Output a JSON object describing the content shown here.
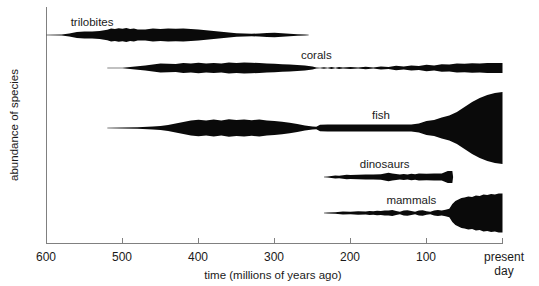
{
  "figure": {
    "title": "",
    "background_color": "#ffffff",
    "ink_color": "#0a0a0a",
    "axis_color": "#808080"
  },
  "axes": {
    "x_axis_title": "time (millions of years ago)",
    "y_axis_title": "abundance of species",
    "x_ticks": [
      {
        "label": "600",
        "value": 600
      },
      {
        "label": "500",
        "value": 500
      },
      {
        "label": "400",
        "value": 400
      },
      {
        "label": "300",
        "value": 300
      },
      {
        "label": "200",
        "value": 200
      },
      {
        "label": "100",
        "value": 100
      },
      {
        "label": "present",
        "label2": "day",
        "value": 0
      }
    ]
  },
  "chart_data": {
    "type": "area",
    "title": "",
    "subtitle": "",
    "xlabel": "time (millions of years ago)",
    "ylabel": "abundance of species",
    "xlim": [
      600,
      0
    ],
    "ylim": [
      0,
      1
    ],
    "x_reversed": true,
    "grid": false,
    "legend_position": "inline-labels",
    "annotations": [
      "trilobites",
      "corals",
      "fish",
      "dinosaurs",
      "mammals"
    ],
    "note": "Spindle diagram: each series is a horizontal lens whose half-thickness encodes abundance of species over geologic time.",
    "series": [
      {
        "name": "trilobites",
        "label": "trilobites",
        "label_x": 540,
        "start_mya": 600,
        "end_mya": 255,
        "x": [
          600,
          580,
          570,
          560,
          550,
          540,
          530,
          520,
          515,
          510,
          505,
          500,
          495,
          490,
          485,
          480,
          470,
          460,
          450,
          440,
          430,
          420,
          410,
          400,
          390,
          380,
          370,
          360,
          350,
          340,
          330,
          320,
          310,
          300,
          290,
          280,
          270,
          260,
          255
        ],
        "half_width": [
          0.2,
          0.4,
          1.6,
          3.0,
          3.4,
          3.6,
          4.0,
          5.2,
          6.4,
          6.0,
          6.8,
          6.2,
          7.0,
          6.0,
          6.6,
          5.6,
          5.6,
          6.4,
          6.0,
          6.4,
          6.2,
          6.4,
          6.0,
          5.4,
          4.8,
          4.0,
          3.2,
          2.4,
          1.8,
          1.4,
          1.2,
          1.6,
          2.0,
          2.2,
          1.8,
          1.2,
          0.8,
          0.4,
          0.2
        ]
      },
      {
        "name": "corals",
        "label": "corals",
        "label_x": 245,
        "start_mya": 520,
        "end_mya": 0,
        "x": [
          520,
          500,
          480,
          470,
          460,
          450,
          440,
          430,
          420,
          410,
          400,
          390,
          380,
          370,
          360,
          350,
          340,
          330,
          320,
          310,
          300,
          290,
          280,
          270,
          260,
          250,
          245,
          240,
          235,
          230,
          225,
          220,
          215,
          210,
          200,
          190,
          180,
          170,
          160,
          150,
          140,
          130,
          120,
          110,
          100,
          90,
          80,
          70,
          60,
          50,
          40,
          30,
          20,
          10,
          0
        ],
        "half_width": [
          0.2,
          0.3,
          1.8,
          2.4,
          3.6,
          4.6,
          4.2,
          4.0,
          5.0,
          4.6,
          5.2,
          4.4,
          5.0,
          4.6,
          5.4,
          5.0,
          5.6,
          5.2,
          5.0,
          4.6,
          4.2,
          3.8,
          3.4,
          3.0,
          2.4,
          1.4,
          0.4,
          0.2,
          0.8,
          0.3,
          0.9,
          0.3,
          1.0,
          0.4,
          1.0,
          0.5,
          1.2,
          0.6,
          1.4,
          1.0,
          2.2,
          1.6,
          2.4,
          2.0,
          3.2,
          2.6,
          3.8,
          3.4,
          4.4,
          4.2,
          4.8,
          4.6,
          5.0,
          5.0,
          5.0
        ]
      },
      {
        "name": "fish",
        "label": "fish",
        "label_x": 160,
        "start_mya": 520,
        "end_mya": 0,
        "x": [
          520,
          500,
          480,
          460,
          450,
          440,
          430,
          420,
          410,
          400,
          390,
          380,
          370,
          360,
          350,
          340,
          330,
          320,
          310,
          300,
          290,
          280,
          270,
          260,
          250,
          245,
          240,
          230,
          220,
          210,
          200,
          190,
          180,
          170,
          160,
          150,
          140,
          130,
          120,
          110,
          100,
          90,
          80,
          70,
          60,
          50,
          40,
          30,
          20,
          10,
          0
        ],
        "half_width": [
          0.2,
          0.4,
          0.8,
          1.4,
          2.0,
          3.0,
          4.6,
          6.0,
          7.4,
          8.2,
          7.4,
          8.4,
          7.6,
          8.8,
          8.0,
          8.6,
          7.8,
          8.4,
          7.6,
          7.0,
          6.2,
          5.2,
          4.0,
          2.6,
          1.6,
          1.2,
          3.2,
          3.6,
          3.4,
          3.6,
          3.4,
          3.6,
          3.4,
          3.6,
          3.4,
          3.6,
          3.4,
          3.6,
          3.6,
          4.6,
          7.0,
          8.0,
          10.5,
          12.5,
          16.0,
          21.0,
          26.0,
          30.0,
          33.0,
          35.0,
          36.0
        ]
      },
      {
        "name": "dinosaurs",
        "label": "dinosaurs",
        "label_x": 155,
        "start_mya": 235,
        "end_mya": 65,
        "x": [
          235,
          230,
          225,
          220,
          215,
          210,
          205,
          200,
          190,
          180,
          170,
          160,
          155,
          150,
          145,
          140,
          135,
          130,
          125,
          120,
          115,
          110,
          100,
          90,
          80,
          72,
          66,
          65
        ],
        "half_width": [
          0.2,
          0.6,
          1.0,
          1.4,
          1.2,
          1.8,
          2.2,
          2.0,
          2.2,
          2.4,
          2.6,
          2.8,
          3.4,
          4.2,
          3.4,
          3.0,
          2.4,
          3.0,
          2.6,
          3.2,
          2.8,
          3.4,
          3.2,
          3.6,
          3.4,
          6.0,
          6.0,
          0.2
        ]
      },
      {
        "name": "mammals",
        "label": "mammals",
        "label_x": 120,
        "start_mya": 235,
        "end_mya": 0,
        "x": [
          235,
          230,
          220,
          210,
          200,
          190,
          180,
          175,
          170,
          165,
          160,
          155,
          150,
          145,
          140,
          135,
          130,
          125,
          120,
          115,
          110,
          105,
          100,
          95,
          90,
          85,
          80,
          75,
          70,
          66,
          62,
          58,
          54,
          50,
          45,
          40,
          35,
          30,
          25,
          20,
          15,
          10,
          5,
          0
        ],
        "half_width": [
          0.2,
          0.4,
          0.8,
          1.4,
          1.2,
          1.8,
          1.6,
          2.0,
          1.8,
          2.2,
          2.0,
          2.4,
          2.6,
          3.0,
          2.0,
          1.2,
          2.4,
          2.8,
          2.0,
          1.2,
          2.4,
          2.8,
          1.8,
          1.2,
          2.6,
          3.0,
          2.4,
          3.2,
          4.2,
          9.0,
          12.0,
          13.5,
          15.0,
          15.5,
          16.5,
          16.0,
          17.5,
          17.0,
          18.5,
          18.0,
          19.0,
          18.5,
          19.5,
          19.5
        ]
      }
    ]
  }
}
